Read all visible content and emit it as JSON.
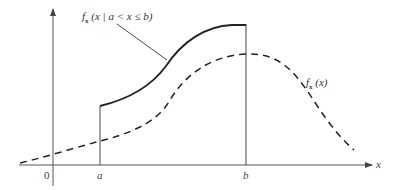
{
  "diagram": {
    "type": "probability-density-illustration",
    "axes": {
      "x_label": "x",
      "origin_label": "0",
      "x_ticks": [
        "a",
        "b"
      ]
    },
    "curves": [
      {
        "name": "conditional-density",
        "style": "solid",
        "label_func": "f",
        "label_sub": "x",
        "label_arg": "(x | a < x ≤ b)"
      },
      {
        "name": "unconditional-density",
        "style": "dashed",
        "label_func": "f",
        "label_sub": "x",
        "label_arg": "(x)"
      }
    ],
    "colors": {
      "line": "#222222",
      "axis": "#555555",
      "text": "#333333"
    }
  }
}
